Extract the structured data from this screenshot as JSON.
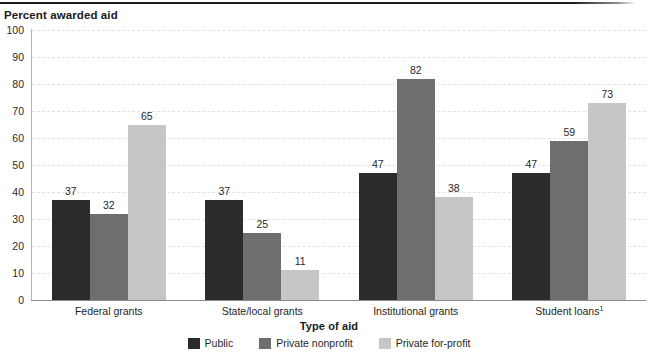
{
  "chart_data": {
    "type": "bar",
    "title": "Percent awarded aid",
    "xlabel": "Type of aid",
    "ylabel": "Percent awarded aid",
    "ylim": [
      0,
      100
    ],
    "ytick_step": 10,
    "yticks": [
      0,
      10,
      20,
      30,
      40,
      50,
      60,
      70,
      80,
      90,
      100
    ],
    "grid": true,
    "legend_position": "bottom",
    "categories": [
      "Federal grants",
      "State/local grants",
      "Institutional grants",
      "Student loans"
    ],
    "category_footnote_marks": [
      "",
      "",
      "",
      "1"
    ],
    "series": [
      {
        "name": "Public",
        "color": "#2b2b2b",
        "values": [
          37,
          37,
          47,
          47
        ]
      },
      {
        "name": "Private nonprofit",
        "color": "#6e6e6e",
        "values": [
          32,
          25,
          82,
          59
        ]
      },
      {
        "name": "Private for-profit",
        "color": "#c6c6c6",
        "values": [
          65,
          11,
          38,
          73
        ]
      }
    ]
  },
  "legend": {
    "items": [
      {
        "label": "Public",
        "color": "#2b2b2b"
      },
      {
        "label": "Private nonprofit",
        "color": "#6e6e6e"
      },
      {
        "label": "Private for-profit",
        "color": "#c6c6c6"
      }
    ]
  },
  "colors": {
    "public": "#2b2b2b",
    "private_nonprofit": "#6e6e6e",
    "private_for_profit": "#c6c6c6",
    "gridline": "#e2e2e2",
    "axis": "#8a8a8a",
    "rule": "#1d1d1d"
  }
}
